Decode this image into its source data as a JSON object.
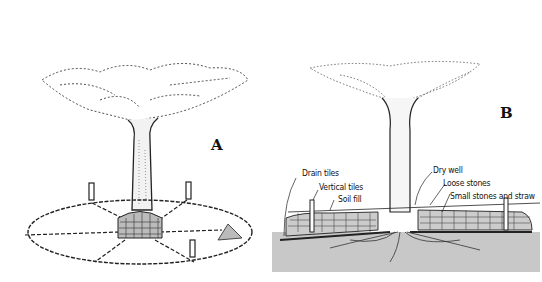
{
  "figure": {
    "panels": [
      {
        "id": "A",
        "letter": "A",
        "view": "perspective view of tree well with radial drain tiles"
      },
      {
        "id": "B",
        "letter": "B",
        "view": "cross-section of tree well"
      }
    ],
    "labels_b": {
      "drain_tiles": "Drain tiles",
      "vertical_tiles": "Vertical tiles",
      "soil_fill": "Soil fill",
      "dry_well": "Dry well",
      "loose_stones": "Loose stones",
      "small_stones": "Small stones and straw"
    },
    "colors": {
      "ink": "#111111",
      "ground": "#c8c8c8",
      "background": "#ffffff"
    }
  }
}
